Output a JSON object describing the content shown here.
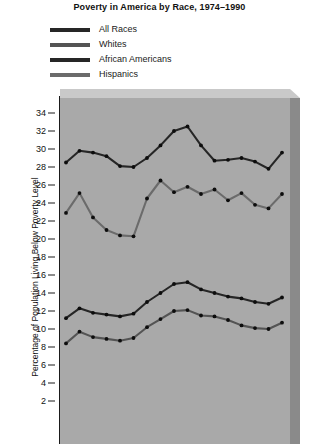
{
  "title": "Poverty in America by Race, 1974–1990",
  "y_axis_title": "Percentage of Population Living Below Poverty Level",
  "legend": {
    "items": [
      {
        "label": "All Races",
        "color": "#262626",
        "swatch": "legend-swatch-all-races"
      },
      {
        "label": "Whites",
        "color": "#545454",
        "swatch": "legend-swatch-whites"
      },
      {
        "label": "African Americans",
        "color": "#262626",
        "swatch": "legend-swatch-african-americans"
      },
      {
        "label": "Hispanics",
        "color": "#6b6b6b",
        "swatch": "legend-swatch-hispanics"
      }
    ]
  },
  "y_ticks": [
    "34",
    "32",
    "30",
    "28",
    "26",
    "24",
    "22",
    "20",
    "18",
    "16",
    "14",
    "12",
    "10",
    "8",
    "6",
    "4",
    "2"
  ],
  "colors": {
    "plot_background": "#a9a9a9",
    "slab_top": "#c9c9c9",
    "slab_right": "#8a8a8a",
    "axis": "#1a1a1a",
    "text": "#111111"
  },
  "chart_data": {
    "type": "line",
    "title": "Poverty in America by Race, 1974–1990",
    "xlabel": "",
    "ylabel": "Percentage of Population Living Below Poverty Level",
    "ylim": [
      1,
      35
    ],
    "ytick_step": 2,
    "grid": false,
    "legend_position": "top-left",
    "x": [
      1974,
      1975,
      1976,
      1977,
      1978,
      1979,
      1980,
      1981,
      1982,
      1983,
      1984,
      1985,
      1986,
      1987,
      1988,
      1989,
      1990
    ],
    "series": [
      {
        "name": "All Races",
        "color": "#262626",
        "values": [
          11.2,
          12.3,
          11.8,
          11.6,
          11.4,
          11.7,
          13.0,
          14.0,
          15.0,
          15.2,
          14.4,
          14.0,
          13.6,
          13.4,
          13.0,
          12.8,
          13.5
        ]
      },
      {
        "name": "Whites",
        "color": "#545454",
        "values": [
          8.4,
          9.7,
          9.1,
          8.9,
          8.7,
          9.0,
          10.2,
          11.1,
          12.0,
          12.1,
          11.5,
          11.4,
          11.0,
          10.4,
          10.1,
          10.0,
          10.7
        ]
      },
      {
        "name": "African Americans",
        "color": "#262626",
        "values": [
          28.5,
          29.8,
          29.6,
          29.2,
          28.1,
          28.0,
          29.0,
          30.4,
          32.0,
          32.5,
          30.4,
          28.7,
          28.8,
          29.0,
          28.6,
          27.8,
          29.6
        ]
      },
      {
        "name": "Hispanics",
        "color": "#6b6b6b",
        "values": [
          22.9,
          25.1,
          22.4,
          21.0,
          20.4,
          20.3,
          24.5,
          26.5,
          25.2,
          25.8,
          25.0,
          25.5,
          24.3,
          25.1,
          23.8,
          23.4,
          25.0
        ]
      }
    ]
  }
}
